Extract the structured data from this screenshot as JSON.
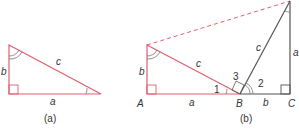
{
  "colors": {
    "red": "#e06070",
    "gray": "#555555",
    "text": "#333333"
  },
  "figure_a": {
    "caption": "(a)",
    "labels": {
      "side_b": "b",
      "side_c": "c",
      "side_a": "a"
    }
  },
  "figure_b": {
    "caption": "(b)",
    "labels": {
      "side_b_left": "b",
      "side_c_left": "c",
      "side_a_bottom": "a",
      "side_c_right": "c",
      "side_a_right": "a",
      "side_b_bottom": "b",
      "vertex_A": "A",
      "vertex_B": "B",
      "vertex_C": "C",
      "angle_1": "1",
      "angle_2": "2",
      "angle_3": "3"
    }
  }
}
